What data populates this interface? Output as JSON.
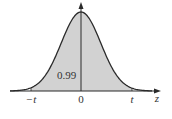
{
  "diagram": {
    "type": "normal-distribution-curve",
    "axis": {
      "variable_label": "z",
      "ticks": [
        {
          "label": "−t",
          "x": 31
        },
        {
          "label": "0",
          "x": 81
        },
        {
          "label": "t",
          "x": 132
        }
      ]
    },
    "shaded_region": {
      "from": "−t",
      "to": "t",
      "area_label": "0.99"
    },
    "colors": {
      "shade": "#d2d2d2",
      "curve": "#2a2a2a",
      "axis": "#2a2a2a",
      "text": "#333333"
    }
  }
}
